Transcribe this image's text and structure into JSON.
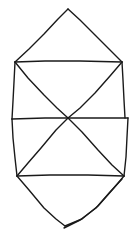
{
  "canvas": {
    "width": 138,
    "height": 235,
    "background_color": "#ffffff",
    "description": "Hand-drawn line figure: an elongated hexagonal/crystal outline made of a top triangular peak, two stacked quadrilateral bands each crossed by diagonals meeting at a shared center, and a bottom triangular peak whose right edge is drawn twice."
  },
  "drawing": {
    "stroke_color": "#1a1a1a",
    "stroke_width": 1.4,
    "style": "hand-drawn-pen",
    "fill": "none",
    "shape_name": "stacked-crystal-outline",
    "segments": [
      {
        "name": "top-peak-left-edge",
        "points": "68,9 58,19 44,34 29,49 15,62"
      },
      {
        "name": "top-peak-right-edge",
        "points": "68,9 80,20 95,35 109,49 122,62"
      },
      {
        "name": "upper-band-top-edge",
        "points": "15,62 45,61 80,61 122,62"
      },
      {
        "name": "upper-band-left-edge",
        "points": "15,62 14,82 13,101 12,119"
      },
      {
        "name": "upper-band-right-edge",
        "points": "122,62 123,80 124,100 125,118"
      },
      {
        "name": "upper-band-diagonal-left-to-center",
        "points": "15,62 28,78 44,95 57,108 68,118"
      },
      {
        "name": "upper-band-diagonal-right-to-center",
        "points": "122,62 110,76 95,93 80,108 68,118"
      },
      {
        "name": "middle-band-top-edge",
        "points": "12,119 45,118 85,118 128,118"
      },
      {
        "name": "lower-band-left-edge",
        "points": "12,119 13,138 15,158 17,176"
      },
      {
        "name": "lower-band-right-edge",
        "points": "128,118 127,137 126,157 124,176"
      },
      {
        "name": "lower-band-diagonal-center-to-left",
        "points": "68,118 56,130 41,148 28,163 17,176"
      },
      {
        "name": "lower-band-diagonal-center-to-right",
        "points": "68,118 82,132 98,150 112,165 124,176"
      },
      {
        "name": "lower-band-bottom-edge",
        "points": "17,176 50,175 88,175 124,176"
      },
      {
        "name": "bottom-peak-left-edge",
        "points": "17,176 29,190 44,208 56,219 65,226"
      },
      {
        "name": "bottom-peak-right-edge-outer",
        "points": "124,176 113,189 98,206 82,219 65,226"
      },
      {
        "name": "bottom-peak-right-edge-inner",
        "points": "122,179 110,192 96,208 80,220 64,228"
      }
    ]
  }
}
